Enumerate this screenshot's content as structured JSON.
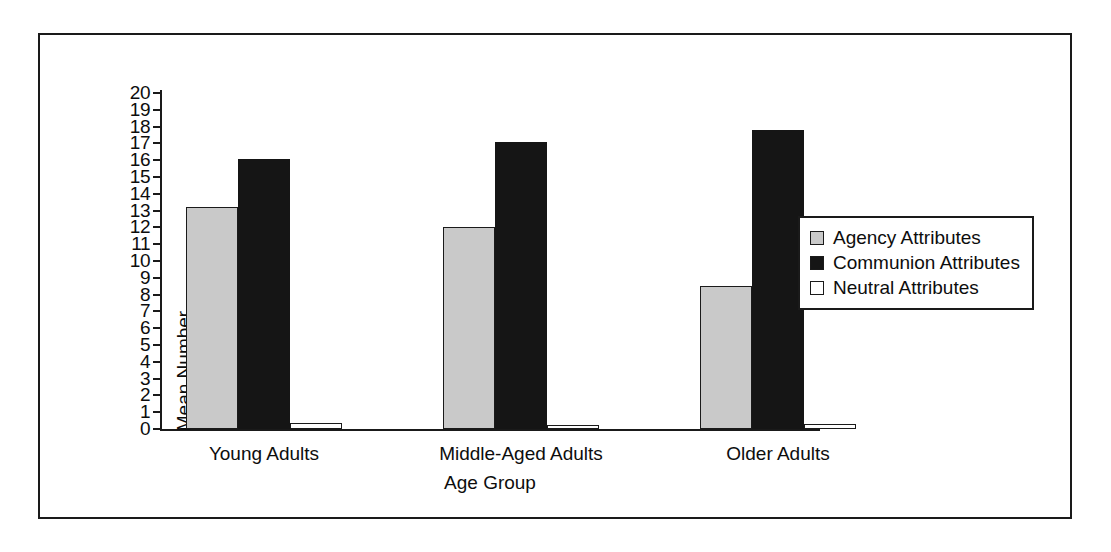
{
  "figure": {
    "has_frame": true,
    "frame_color": "#1a1a1a",
    "background": "#ffffff"
  },
  "axes": {
    "y_title": "Mean Number",
    "x_title": "Age Group",
    "y_ticks": [
      "20",
      "19",
      "18",
      "17",
      "16",
      "15",
      "14",
      "13",
      "12",
      "11",
      "10",
      "9",
      "8",
      "7",
      "6",
      "5",
      "4",
      "3",
      "2",
      "1",
      "0"
    ]
  },
  "legend": {
    "items": [
      {
        "label": "Agency Attributes",
        "color": "#c9c9c9"
      },
      {
        "label": "Communion Attributes",
        "color": "#151515"
      },
      {
        "label": "Neutral Attributes",
        "color": "#ffffff"
      }
    ]
  },
  "chart_data": {
    "type": "bar",
    "title": "",
    "subtitle": "",
    "xlabel": "Age Group",
    "ylabel": "Mean Number",
    "categories": [
      "Young Adults",
      "Middle-Aged Adults",
      "Older Adults"
    ],
    "series": [
      {
        "name": "Agency Attributes",
        "color": "#c9c9c9",
        "values": [
          13.2,
          12.0,
          8.5
        ]
      },
      {
        "name": "Communion Attributes",
        "color": "#151515",
        "values": [
          16.1,
          17.1,
          17.8
        ]
      },
      {
        "name": "Neutral Attributes",
        "color": "#ffffff",
        "values": [
          0.35,
          0.25,
          0.3
        ]
      }
    ],
    "ylim": [
      0,
      20
    ],
    "ytick_step": 1,
    "grid": false,
    "legend_position": "right-middle",
    "bar_grouping": "grouped",
    "annotations": []
  }
}
